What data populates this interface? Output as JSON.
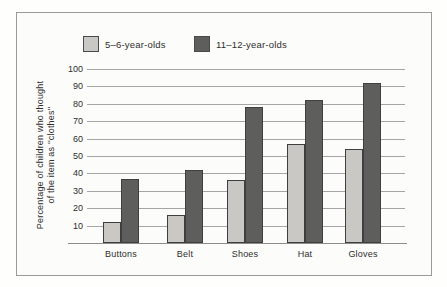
{
  "chart_data": {
    "type": "bar",
    "categories": [
      "Buttons",
      "Belt",
      "Shoes",
      "Hat",
      "Gloves"
    ],
    "series": [
      {
        "name": "5–6-year-olds",
        "values": [
          12,
          16,
          36,
          57,
          54
        ],
        "color": "#c9c8c4"
      },
      {
        "name": "11–12-year-olds",
        "values": [
          37,
          42,
          78,
          82,
          92
        ],
        "color": "#5e5e5c"
      }
    ],
    "title": "",
    "xlabel": "",
    "ylabel_line1": "Percentage of children who thought",
    "ylabel_line2": "of the item as ''clothes''",
    "yticks": [
      10,
      20,
      30,
      40,
      50,
      60,
      70,
      80,
      90,
      100
    ],
    "ylim": [
      0,
      100
    ],
    "grid": true,
    "legend_position": "top"
  },
  "colors": {
    "light_series": "#c9c8c4",
    "dark_series": "#5e5e5c",
    "gridline": "#a5a5a5",
    "frame_border": "#9a9a9a",
    "text": "#2e2e2e"
  }
}
